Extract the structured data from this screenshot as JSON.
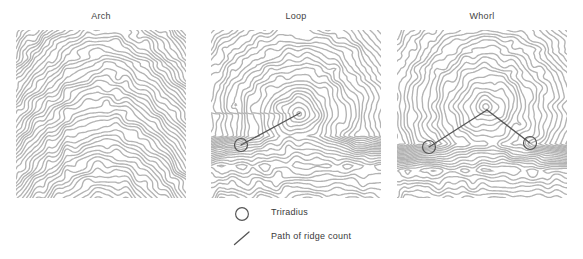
{
  "figure": {
    "caption_present": false,
    "background_color": "#ffffff",
    "ridge_color": "#b3b3b3",
    "marker_color": "#555555",
    "text_color": "#3a3a3a"
  },
  "panels": [
    {
      "id": "arch",
      "title": "Arch",
      "title_x": 101,
      "title_y": 17,
      "x": 16,
      "y": 30,
      "width": 170,
      "height": 168,
      "pattern": "arch",
      "triradii": [],
      "ridge_count_paths": [],
      "core": null
    },
    {
      "id": "loop",
      "title": "Loop",
      "title_x": 296,
      "title_y": 17,
      "x": 211,
      "y": 30,
      "width": 170,
      "height": 168,
      "pattern": "loop",
      "triradii": [
        {
          "cx": 30,
          "cy": 115,
          "r": 6.5
        }
      ],
      "ridge_count_paths": [
        {
          "x1": 30,
          "y1": 115,
          "x2": 89,
          "y2": 83
        }
      ],
      "core": {
        "cx": 89,
        "cy": 83
      }
    },
    {
      "id": "whorl",
      "title": "Whorl",
      "title_x": 482,
      "title_y": 17,
      "x": 397,
      "y": 30,
      "width": 170,
      "height": 168,
      "pattern": "whorl",
      "triradii": [
        {
          "cx": 32,
          "cy": 117,
          "r": 6.5
        },
        {
          "cx": 133,
          "cy": 113,
          "r": 6.5
        }
      ],
      "ridge_count_paths": [
        {
          "x1": 32,
          "y1": 117,
          "x2": 90,
          "y2": 80
        },
        {
          "x1": 90,
          "y1": 80,
          "x2": 133,
          "y2": 113
        }
      ],
      "core": {
        "cx": 90,
        "cy": 80
      }
    }
  ],
  "legend": {
    "items": [
      {
        "icon": "triradius-circle-icon",
        "label": "Triradius"
      },
      {
        "icon": "ridge-count-line-icon",
        "label": "Path of ridge count"
      }
    ]
  }
}
